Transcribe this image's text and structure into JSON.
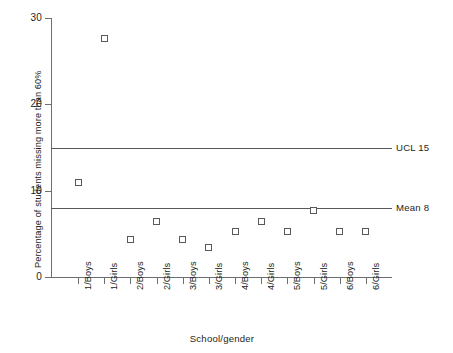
{
  "chart_data": {
    "type": "scatter",
    "title": "",
    "xlabel": "School/gender",
    "ylabel": "Percentage of students missing more than 60%",
    "categories": [
      "1/Boys",
      "1/Girls",
      "2/Boys",
      "2/Girls",
      "3/Boys",
      "3/Girls",
      "4/Boys",
      "4/Girls",
      "5/Boys",
      "5/Girls",
      "6/Boys",
      "6/Girls"
    ],
    "values": [
      11,
      27.6,
      4.4,
      6.4,
      4.4,
      3.4,
      5.3,
      6.4,
      5.3,
      7.7,
      5.3,
      5.3
    ],
    "ylim": [
      0,
      30
    ],
    "y_ticks": [
      0,
      10,
      20,
      30
    ],
    "y_tick_labels": [
      "0",
      "10",
      "20",
      "30"
    ],
    "grid": false,
    "legend": "none",
    "marker": "open-square",
    "reference_lines": [
      {
        "name": "UCL",
        "label": "UCL 15",
        "value": 15
      },
      {
        "name": "Mean",
        "label": "Mean 8",
        "value": 8
      }
    ],
    "colors": {
      "axis": "#6d6e70",
      "line": "#58595b",
      "marker_stroke": "#58595b",
      "marker_fill": "#ffffff",
      "text": "#231f20",
      "background": "#ffffff"
    }
  }
}
